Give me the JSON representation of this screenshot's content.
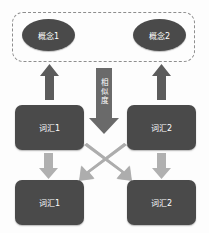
{
  "diagram": {
    "colors": {
      "node_fill": "#4a4a4a",
      "node_text": "#ffffff",
      "dashed_border": "#8e8e8e",
      "arrow_dark": "#595959",
      "arrow_light": "#a8a8a8",
      "background": "#fdfdfd"
    },
    "concept_group": {
      "name": "concept-layer",
      "nodes": [
        {
          "id": "concept-1",
          "label": "概念1",
          "shape": "ellipse"
        },
        {
          "id": "concept-2",
          "label": "概念2",
          "shape": "ellipse"
        }
      ]
    },
    "word_layer_upper": {
      "nodes": [
        {
          "id": "word-top-left",
          "label": "词汇1",
          "shape": "rounded-rect"
        },
        {
          "id": "word-top-right",
          "label": "词汇2",
          "shape": "rounded-rect"
        }
      ]
    },
    "word_layer_lower": {
      "nodes": [
        {
          "id": "word-bottom-left",
          "label": "词汇1",
          "shape": "rounded-rect"
        },
        {
          "id": "word-bottom-right",
          "label": "词汇2",
          "shape": "rounded-rect"
        }
      ]
    },
    "center_arrow": {
      "id": "similarity-arrow",
      "label": "相似度",
      "label_chars": [
        "相",
        "似",
        "度"
      ],
      "direction": "down",
      "style": "dark"
    },
    "arrows": [
      {
        "id": "arrow-word1-to-concept1",
        "from": "word-top-left",
        "to": "concept-1",
        "direction": "up",
        "style": "dark"
      },
      {
        "id": "arrow-word2-to-concept2",
        "from": "word-top-right",
        "to": "concept-2",
        "direction": "up",
        "style": "dark"
      },
      {
        "id": "arrow-word1-down",
        "from": "word-top-left",
        "to": "word-bottom-left",
        "direction": "down",
        "style": "light"
      },
      {
        "id": "arrow-word2-down",
        "from": "word-top-right",
        "to": "word-bottom-right",
        "direction": "down",
        "style": "light"
      },
      {
        "id": "arrow-cross-left-right",
        "from": "word-top-left",
        "to": "word-bottom-right",
        "direction": "diagonal-down-right",
        "style": "light"
      },
      {
        "id": "arrow-cross-right-left",
        "from": "word-top-right",
        "to": "word-bottom-left",
        "direction": "diagonal-down-left",
        "style": "light"
      }
    ]
  }
}
